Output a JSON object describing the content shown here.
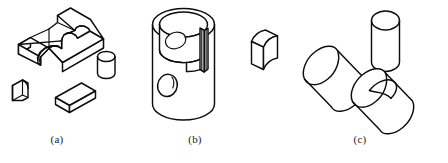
{
  "figure": {
    "background_color": "#ffffff",
    "line_color": "#0d0d0d",
    "panels": [
      {
        "id": "a",
        "caption": "(a)",
        "description": "Slotted rectangular block with semicircular notch, plus a small curved block, a rectangular bar, and a short cylinder",
        "parts": [
          {
            "name": "slotted-block",
            "shape": "rectangular block with U-slot and semicircular notch"
          },
          {
            "name": "curved-block",
            "shape": "small block with concave curved face"
          },
          {
            "name": "rectangular-bar",
            "shape": "rectangular bar"
          },
          {
            "name": "short-cylinder",
            "shape": "short circular cylinder"
          }
        ]
      },
      {
        "id": "b",
        "caption": "(b)",
        "description": "Hollow cylinder with through hole, internal vertical rib, and a matching curved segment block",
        "parts": [
          {
            "name": "hollow-cylinder",
            "shape": "hollow cylinder with side through-hole and internal rib"
          },
          {
            "name": "curved-segment-block",
            "shape": "arc-shaped segment block"
          }
        ]
      },
      {
        "id": "c",
        "caption": "(c)",
        "description": "Plain horizontal cylinder, an upright cylinder, and a horizontal cylinder with an oval cross hole",
        "parts": [
          {
            "name": "plain-cylinder",
            "shape": "horizontal solid cylinder"
          },
          {
            "name": "upright-cylinder",
            "shape": "vertical solid cylinder"
          },
          {
            "name": "drilled-cylinder",
            "shape": "horizontal cylinder with oval cross hole"
          }
        ]
      }
    ]
  },
  "captions": {
    "a": "(a)",
    "b": "(b)",
    "c": "(c)"
  }
}
